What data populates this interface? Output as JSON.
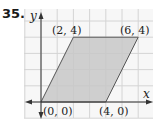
{
  "problem_number": "35.",
  "chart_data": {
    "type": "scatter",
    "title": "",
    "xlabel": "x",
    "ylabel": "y",
    "shape": "parallelogram",
    "points": [
      {
        "label": "(0, 0)",
        "x": 0,
        "y": 0
      },
      {
        "label": "(4, 0)",
        "x": 4,
        "y": 0
      },
      {
        "label": "(6, 4)",
        "x": 6,
        "y": 4
      },
      {
        "label": "(2, 4)",
        "x": 2,
        "y": 4
      }
    ],
    "xlim": [
      -1,
      7
    ],
    "ylim": [
      -1,
      5
    ],
    "grid": true,
    "fill_color": "#c8c8c8",
    "grid_color": "#d4d4d4"
  }
}
